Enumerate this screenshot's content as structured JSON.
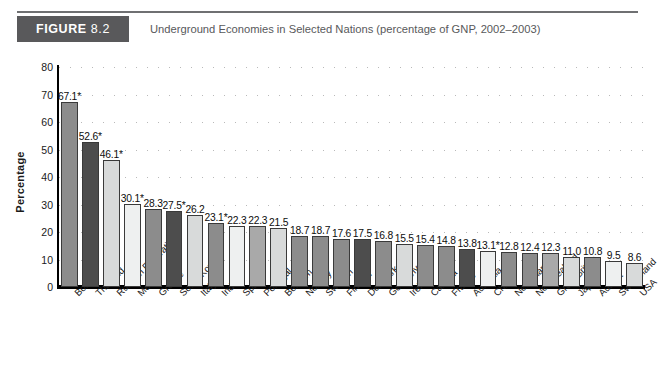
{
  "figure": {
    "tag_word": "FIGURE",
    "tag_number": "8.2",
    "title": "Underground Economies in Selected Nations (percentage of GNP, 2002–2003)"
  },
  "colors": {
    "header_block": "#59595b",
    "header_rule": "#6f7072",
    "bar_dark": "#4d4d4d",
    "bar_mid": "#8c8c8c",
    "bar_light": "#d8dada",
    "bar_pale": "#eef0f0",
    "axis": "#000000",
    "grid": "#b9b9b9"
  },
  "chart_data": {
    "type": "bar",
    "title": "Underground Economies in Selected Nations (percentage of GNP, 2002–2003)",
    "xlabel": "",
    "ylabel": "Percentage",
    "ylim": [
      0,
      80
    ],
    "yticks": [
      "0",
      "10",
      "20",
      "30",
      "40",
      "50",
      "60",
      "70",
      "80"
    ],
    "grid": true,
    "legend": "none",
    "categories": [
      "Bolivia",
      "Thailand",
      "Russian Federation",
      "Mexico",
      "Greece",
      "South Korea",
      "Italy",
      "India",
      "Spain",
      "Portugal",
      "Belgium",
      "Norway",
      "Sweden",
      "Finland",
      "Denmark",
      "Germany",
      "Ireland",
      "Canada",
      "France",
      "Australia",
      "China",
      "Netherlands",
      "New Zealand",
      "Great Britain",
      "Japan",
      "Austria",
      "Switzerland",
      "USA"
    ],
    "values": [
      67.1,
      52.6,
      46.1,
      30.1,
      28.3,
      27.5,
      26.2,
      23.1,
      22.3,
      22.3,
      21.5,
      18.7,
      18.7,
      17.6,
      17.5,
      16.8,
      15.5,
      15.4,
      14.8,
      13.8,
      13.1,
      12.8,
      12.4,
      12.3,
      11.0,
      10.8,
      9.5,
      8.6
    ],
    "value_labels": [
      "67.1*",
      "52.6*",
      "46.1*",
      "30.1*",
      "28.3",
      "27.5*",
      "26.2",
      "23.1*",
      "22.3",
      "22.3",
      "21.5",
      "18.7",
      "18.7",
      "17.6",
      "17.5",
      "16.8",
      "15.5",
      "15.4",
      "14.8",
      "13.8",
      "13.1*",
      "12.8",
      "12.4",
      "12.3",
      "11.0",
      "10.8",
      "9.5",
      "8.6"
    ],
    "bar_shades": [
      "#8c8c8c",
      "#4d4d4d",
      "#d8dada",
      "#eef0f0",
      "#8c8c8c",
      "#4d4d4d",
      "#d8dada",
      "#8c8c8c",
      "#eef0f0",
      "#a9a9a9",
      "#d8dada",
      "#8c8c8c",
      "#8c8c8c",
      "#8c8c8c",
      "#4d4d4d",
      "#8c8c8c",
      "#d8dada",
      "#8c8c8c",
      "#8c8c8c",
      "#4d4d4d",
      "#eef0f0",
      "#8c8c8c",
      "#8c8c8c",
      "#a9a9a9",
      "#d8dada",
      "#8c8c8c",
      "#eef0f0",
      "#d8dada"
    ],
    "footnote_marker": "*"
  }
}
